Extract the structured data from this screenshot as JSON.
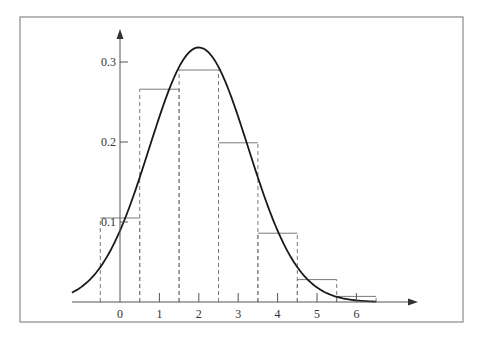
{
  "chart_data": {
    "type": "bar",
    "title": "",
    "xlabel": "",
    "ylabel": "",
    "categories": [
      "0",
      "1",
      "2",
      "3",
      "4",
      "5",
      "6"
    ],
    "values": [
      0.105,
      0.266,
      0.29,
      0.199,
      0.086,
      0.028,
      0.007
    ],
    "bar_width": 1,
    "series": [
      {
        "name": "histogram",
        "type": "bar",
        "x": [
          0,
          1,
          2,
          3,
          4,
          5,
          6
        ],
        "values": [
          0.105,
          0.266,
          0.29,
          0.199,
          0.086,
          0.028,
          0.007
        ]
      },
      {
        "name": "normal curve",
        "type": "line",
        "mean": 2,
        "sd": 1.254,
        "peak": 0.318,
        "x_range": [
          -1.22,
          6.5
        ]
      }
    ],
    "x_ticks": [
      "0",
      "1",
      "2",
      "3",
      "4",
      "5",
      "6"
    ],
    "y_ticks": [
      "0.1",
      "0.2",
      "0.3"
    ],
    "xlim": [
      -1.22,
      7.3
    ],
    "ylim": [
      0,
      0.35
    ],
    "grid": false,
    "legend": null,
    "colors": {
      "curve": "#1a1a1a",
      "bars": "#7a7a7a",
      "frame": "#8a8a8a"
    }
  },
  "axes": {
    "x_labels": [
      "0",
      "1",
      "2",
      "3",
      "4",
      "5",
      "6"
    ],
    "y_labels": [
      "0.1",
      "0.2",
      "0.3"
    ]
  }
}
